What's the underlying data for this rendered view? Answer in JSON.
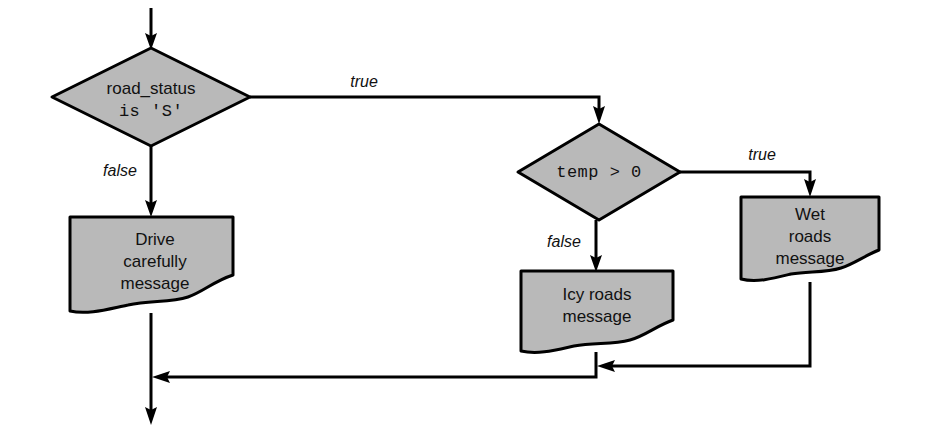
{
  "diagram": {
    "type": "flowchart",
    "title": "",
    "colors": {
      "shape_fill": "#b9b9b9",
      "shape_stroke": "#000000",
      "connector": "#000000",
      "background": "#ffffff",
      "text": "#111111"
    },
    "nodes": [
      {
        "id": "decision-road-status",
        "shape": "diamond",
        "lines": [
          "road_status",
          "is 'S'"
        ],
        "line1": "road_status",
        "line2": "is 'S'",
        "font": "sans-mixed"
      },
      {
        "id": "decision-temp",
        "shape": "diamond",
        "lines": [
          "temp > 0"
        ],
        "line1": "temp > 0",
        "font": "monospace"
      },
      {
        "id": "output-drive-carefully",
        "shape": "document",
        "lines": [
          "Drive",
          "carefully",
          "message"
        ],
        "line1": "Drive",
        "line2": "carefully",
        "line3": "message"
      },
      {
        "id": "output-icy-roads",
        "shape": "document",
        "lines": [
          "Icy roads",
          "message"
        ],
        "line1": "Icy roads",
        "line2": "message"
      },
      {
        "id": "output-wet-roads",
        "shape": "document",
        "lines": [
          "Wet",
          "roads",
          "message"
        ],
        "line1": "Wet",
        "line2": "roads",
        "line3": "message"
      }
    ],
    "edge_labels": {
      "road_status_true": "true",
      "road_status_false": "false",
      "temp_true": "true",
      "temp_false": "false"
    }
  }
}
